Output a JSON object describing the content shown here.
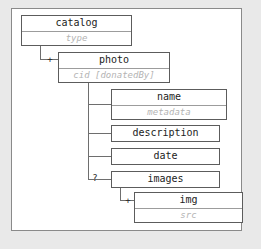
{
  "diagram": {
    "type": "xml-schema-tree",
    "colors": {
      "page_background": "#e9e9e9",
      "frame_background": "#ffffff",
      "frame_border": "#8a8a8a",
      "node_border": "#5c5c5c",
      "title_text": "#1c1c1c",
      "subtitle_text": "#b4b4b4",
      "connector": "#6e6e6e"
    },
    "nodes": [
      {
        "id": "catalog",
        "title": "catalog",
        "subtitle": "type",
        "cardinality": "",
        "level": 0
      },
      {
        "id": "photo",
        "title": "photo",
        "subtitle": "cid [donatedBy]",
        "cardinality": "+",
        "level": 1
      },
      {
        "id": "name",
        "title": "name",
        "subtitle": "metadata",
        "cardinality": "",
        "level": 2
      },
      {
        "id": "description",
        "title": "description",
        "subtitle": "",
        "cardinality": "",
        "level": 2
      },
      {
        "id": "date",
        "title": "date",
        "subtitle": "",
        "cardinality": "",
        "level": 2
      },
      {
        "id": "images",
        "title": "images",
        "subtitle": "",
        "cardinality": "?",
        "level": 2
      },
      {
        "id": "img",
        "title": "img",
        "subtitle": "src",
        "cardinality": "+",
        "level": 3
      }
    ]
  }
}
